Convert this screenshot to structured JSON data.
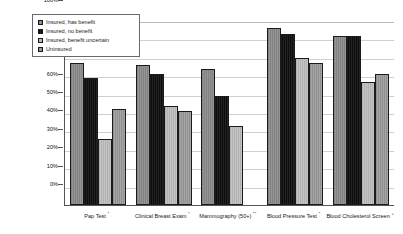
{
  "chart_data": {
    "type": "bar",
    "title": "",
    "xlabel": "",
    "ylabel": "",
    "ylim": [
      0,
      100
    ],
    "ytick_labels": [
      "100%",
      "90%",
      "80%",
      "70%",
      "60%",
      "50%",
      "40%",
      "30%",
      "20%",
      "10%",
      "0%"
    ],
    "ytick_values": [
      100,
      90,
      80,
      70,
      60,
      50,
      40,
      30,
      20,
      10,
      0
    ],
    "grid": true,
    "legend_position": "top-left-inside",
    "categories": [
      "Pap Test *",
      "Clinical Breast Exam *",
      "Mammography (50+) **",
      "Blood Pressure Test *",
      "Blood Cholesterol Screen +"
    ],
    "category_names": [
      "Pap Test",
      "Clinical Breast Exam",
      "Mammography (50+)",
      "Blood Pressure Test",
      "Blood Cholesterol Screen"
    ],
    "category_footnote_marks": [
      "*",
      "*",
      "**",
      "*",
      "+"
    ],
    "series": [
      {
        "name": "Insured, has benefit",
        "color": "#8a8a8a",
        "values": [
          77,
          76,
          74,
          96,
          92
        ]
      },
      {
        "name": "Insured, no benefit",
        "color": "#141414",
        "values": [
          69,
          71,
          59,
          93,
          92
        ]
      },
      {
        "name": "Insured, benefit uncertain",
        "color": "#b9b9b9",
        "values": [
          36,
          54,
          43,
          80,
          67
        ]
      },
      {
        "name": "Uninsured",
        "color": "#9a9a9a",
        "values": [
          52,
          51,
          null,
          77,
          71
        ]
      }
    ]
  },
  "legend": {
    "items": [
      {
        "label": "Insured, has benefit"
      },
      {
        "label": "Insured, no benefit"
      },
      {
        "label": "Insured, benefit uncertain"
      },
      {
        "label": "Uninsured"
      }
    ]
  },
  "yaxis": {
    "t0": "100%",
    "t1": "90%",
    "t2": "80%",
    "t3": "70%",
    "t4": "60%",
    "t5": "50%",
    "t6": "40%",
    "t7": "30%",
    "t8": "20%",
    "t9": "10%",
    "t10": "0%"
  },
  "xaxis": {
    "c0": "Pap Test",
    "c1": "Clinical Breast Exam",
    "c2": "Mammography (50+)",
    "c3": "Blood Pressure Test",
    "c4": "Blood Cholesterol Screen",
    "m0": "*",
    "m1": "*",
    "m2": "**",
    "m3": "*",
    "m4": "+"
  }
}
